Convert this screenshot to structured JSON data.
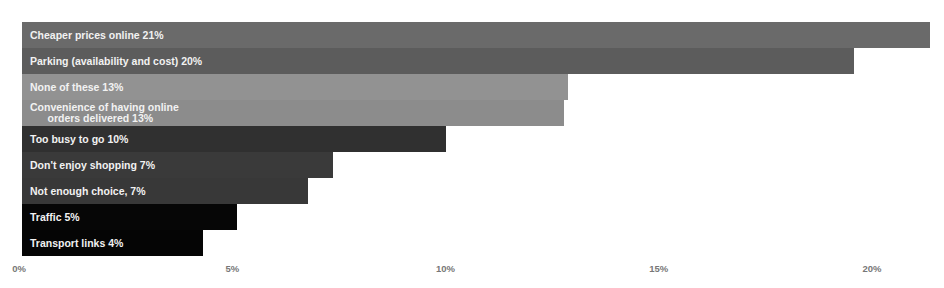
{
  "chart_data": {
    "type": "bar",
    "orientation": "horizontal",
    "title": "",
    "xlabel": "",
    "ylabel": "",
    "xlim": [
      0,
      21.5
    ],
    "x_ticks": [
      "0%",
      "5%",
      "10%",
      "15%",
      "20%"
    ],
    "grid": false,
    "legend": null,
    "categories": [
      "Cheaper prices online",
      "Parking (availability and cost)",
      "None of these",
      "Convenience of having online orders delivered",
      "Too busy to go",
      "Don't enjoy shopping",
      "Not enough choice",
      "Traffic",
      "Transport links"
    ],
    "values": [
      21,
      20,
      13,
      13,
      10,
      7,
      7,
      5,
      4
    ],
    "bars": [
      {
        "label": "Cheaper prices online 21%",
        "value": 21,
        "display_value": 21.3,
        "color": "#6a6a6a"
      },
      {
        "label": "Parking (availability and cost) 20%",
        "value": 20,
        "display_value": 19.5,
        "color": "#5c5c5c"
      },
      {
        "label": "None of these 13%",
        "value": 13,
        "display_value": 12.8,
        "color": "#929292"
      },
      {
        "label": "Convenience of having online\n      orders delivered 13%",
        "value": 13,
        "display_value": 12.7,
        "color": "#8c8c8c"
      },
      {
        "label": "Too busy to go 10%",
        "value": 10,
        "display_value": 9.95,
        "color": "#303030"
      },
      {
        "label": "Don't enjoy shopping 7%",
        "value": 7,
        "display_value": 7.3,
        "color": "#3a3a3a"
      },
      {
        "label": "Not enough choice, 7%",
        "value": 7,
        "display_value": 6.7,
        "color": "#383838"
      },
      {
        "label": "Traffic 5%",
        "value": 5,
        "display_value": 5.05,
        "color": "#060606"
      },
      {
        "label": "Transport links 4%",
        "value": 4,
        "display_value": 4.25,
        "color": "#050505"
      }
    ]
  },
  "axis": {
    "ticks": [
      {
        "label": "0%",
        "value": 0
      },
      {
        "label": "5%",
        "value": 5
      },
      {
        "label": "10%",
        "value": 10
      },
      {
        "label": "15%",
        "value": 15
      },
      {
        "label": "20%",
        "value": 20
      }
    ]
  }
}
